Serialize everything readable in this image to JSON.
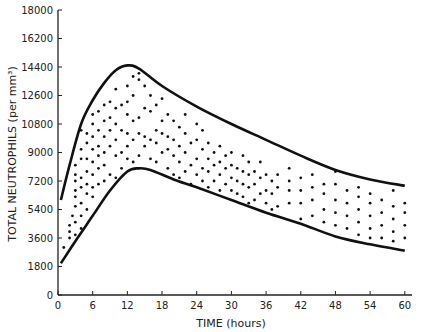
{
  "chart_data": {
    "type": "scatter",
    "title": "",
    "xlabel": "TIME (hours)",
    "ylabel": "TOTAL NEUTROPHILS (per mm³)",
    "xlim": [
      0,
      62
    ],
    "ylim": [
      0,
      18000
    ],
    "x_ticks": [
      0,
      6,
      12,
      18,
      24,
      30,
      36,
      42,
      48,
      54,
      60
    ],
    "y_ticks": [
      0,
      1800,
      3600,
      5400,
      7200,
      9000,
      10800,
      12600,
      14400,
      16200,
      18000
    ],
    "grid": false,
    "legend": null,
    "annotations": "Numerals '2' and '3' mark coincident observations",
    "series": [
      {
        "name": "upper envelope",
        "kind": "line",
        "points": [
          [
            0.5,
            6000
          ],
          [
            2,
            8200
          ],
          [
            4,
            10800
          ],
          [
            6,
            12300
          ],
          [
            8,
            13400
          ],
          [
            10,
            14200
          ],
          [
            12,
            14500
          ],
          [
            14,
            14300
          ],
          [
            18,
            13200
          ],
          [
            24,
            11900
          ],
          [
            30,
            10800
          ],
          [
            36,
            9800
          ],
          [
            42,
            8800
          ],
          [
            48,
            7900
          ],
          [
            54,
            7300
          ],
          [
            60,
            6900
          ]
        ]
      },
      {
        "name": "lower envelope",
        "kind": "line",
        "points": [
          [
            0.5,
            2000
          ],
          [
            3,
            3400
          ],
          [
            6,
            5000
          ],
          [
            9,
            6600
          ],
          [
            12,
            7800
          ],
          [
            14,
            8000
          ],
          [
            16,
            7900
          ],
          [
            20,
            7300
          ],
          [
            24,
            6800
          ],
          [
            30,
            6000
          ],
          [
            36,
            5200
          ],
          [
            42,
            4500
          ],
          [
            48,
            3700
          ],
          [
            54,
            3200
          ],
          [
            60,
            2800
          ]
        ]
      },
      {
        "name": "observations",
        "kind": "scatter",
        "points": [
          [
            1,
            3000
          ],
          [
            2,
            3600
          ],
          [
            2,
            4000
          ],
          [
            2,
            4400
          ],
          [
            2.5,
            5000
          ],
          [
            3,
            3800
          ],
          [
            3,
            4600
          ],
          [
            3,
            5600
          ],
          [
            3,
            6200
          ],
          [
            3,
            6600
          ],
          [
            3,
            7200
          ],
          [
            3,
            7600
          ],
          [
            3,
            8200
          ],
          [
            4,
            4200
          ],
          [
            4,
            5000
          ],
          [
            4,
            5800
          ],
          [
            4,
            6800
          ],
          [
            4,
            7400
          ],
          [
            4,
            8600
          ],
          [
            4,
            9200
          ],
          [
            4,
            10400
          ],
          [
            5,
            5400
          ],
          [
            5,
            6400
          ],
          [
            5,
            7000
          ],
          [
            5,
            7800
          ],
          [
            5,
            8600
          ],
          [
            5,
            9600
          ],
          [
            5,
            10200
          ],
          [
            6,
            6200
          ],
          [
            6,
            6800
          ],
          [
            6,
            7600
          ],
          [
            6,
            8400
          ],
          [
            6,
            9200
          ],
          [
            6,
            10000
          ],
          [
            6,
            10800
          ],
          [
            6,
            11400
          ],
          [
            7,
            7000
          ],
          [
            7,
            8000
          ],
          [
            7,
            8800
          ],
          [
            7,
            9400
          ],
          [
            7,
            10400
          ],
          [
            7,
            11600
          ],
          [
            8,
            7200
          ],
          [
            8,
            8200
          ],
          [
            8,
            9000
          ],
          [
            8,
            10000
          ],
          [
            8,
            11000
          ],
          [
            8,
            12000
          ],
          [
            9,
            7600
          ],
          [
            9,
            9400
          ],
          [
            9,
            10400
          ],
          [
            9,
            11200
          ],
          [
            9,
            12200
          ],
          [
            10,
            7400
          ],
          [
            10,
            8800
          ],
          [
            10,
            9800
          ],
          [
            10,
            10800
          ],
          [
            10,
            11800
          ],
          [
            10,
            13000
          ],
          [
            11,
            8000
          ],
          [
            11,
            9000
          ],
          [
            11,
            10400
          ],
          [
            11,
            12000
          ],
          [
            12,
            8600
          ],
          [
            12,
            9400
          ],
          [
            12,
            10200
          ],
          [
            12,
            11400
          ],
          [
            12,
            12200
          ],
          [
            12,
            13200
          ],
          [
            13,
            8400
          ],
          [
            13,
            9800
          ],
          [
            13,
            11000
          ],
          [
            13,
            12600
          ],
          [
            13,
            13800
          ],
          [
            14,
            8800
          ],
          [
            14,
            10200
          ],
          [
            14,
            11200
          ],
          [
            14,
            13600
          ],
          [
            14,
            14000
          ],
          [
            15,
            9400
          ],
          [
            15,
            10000
          ],
          [
            15,
            11800
          ],
          [
            15,
            13200
          ],
          [
            16,
            8600
          ],
          [
            16,
            9800
          ],
          [
            16,
            11600
          ],
          [
            16,
            12600
          ],
          [
            17,
            8400
          ],
          [
            17,
            9600
          ],
          [
            17,
            10400
          ],
          [
            17,
            12000
          ],
          [
            18,
            9000
          ],
          [
            18,
            10200
          ],
          [
            18,
            11000
          ],
          [
            18,
            12400
          ],
          [
            19,
            8000
          ],
          [
            19,
            9200
          ],
          [
            19,
            10000
          ],
          [
            19,
            11400
          ],
          [
            20,
            7600
          ],
          [
            20,
            8800
          ],
          [
            20,
            9800
          ],
          [
            20,
            11000
          ],
          [
            21,
            7400
          ],
          [
            21,
            8400
          ],
          [
            21,
            9400
          ],
          [
            21,
            10600
          ],
          [
            22,
            7800
          ],
          [
            22,
            9000
          ],
          [
            22,
            10200
          ],
          [
            22,
            11400
          ],
          [
            23,
            7000
          ],
          [
            23,
            8200
          ],
          [
            23,
            9600
          ],
          [
            24,
            7600
          ],
          [
            24,
            8600
          ],
          [
            24,
            9800
          ],
          [
            24,
            10800
          ],
          [
            25,
            7200
          ],
          [
            25,
            8000
          ],
          [
            25,
            9200
          ],
          [
            25,
            10400
          ],
          [
            26,
            6800
          ],
          [
            26,
            7800
          ],
          [
            26,
            8600
          ],
          [
            26,
            9600
          ],
          [
            27,
            7200
          ],
          [
            27,
            8200
          ],
          [
            27,
            9000
          ],
          [
            28,
            6600
          ],
          [
            28,
            7600
          ],
          [
            28,
            8400
          ],
          [
            28,
            9400
          ],
          [
            29,
            7000
          ],
          [
            29,
            8000
          ],
          [
            29,
            8800
          ],
          [
            30,
            6600
          ],
          [
            30,
            7400
          ],
          [
            30,
            8200
          ],
          [
            30,
            9000
          ],
          [
            31,
            6400
          ],
          [
            31,
            7200
          ],
          [
            31,
            8000
          ],
          [
            32,
            6200
          ],
          [
            32,
            7000
          ],
          [
            32,
            7800
          ],
          [
            32,
            8800
          ],
          [
            33,
            5800
          ],
          [
            33,
            6800
          ],
          [
            33,
            7600
          ],
          [
            33,
            8400
          ],
          [
            34,
            6000
          ],
          [
            34,
            7000
          ],
          [
            34,
            7800
          ],
          [
            35,
            6400
          ],
          [
            35,
            7400
          ],
          [
            35,
            8400
          ],
          [
            36,
            5800
          ],
          [
            36,
            6600
          ],
          [
            36,
            7600
          ],
          [
            37,
            5400
          ],
          [
            37,
            6400
          ],
          [
            37,
            7200
          ],
          [
            38,
            5600
          ],
          [
            38,
            6800
          ],
          [
            38,
            7600
          ],
          [
            40,
            5800
          ],
          [
            40,
            6600
          ],
          [
            40,
            7200
          ],
          [
            40,
            8000
          ],
          [
            42,
            4800
          ],
          [
            42,
            5800
          ],
          [
            42,
            6600
          ],
          [
            42,
            7400
          ],
          [
            44,
            5000
          ],
          [
            44,
            6000
          ],
          [
            44,
            6800
          ],
          [
            44,
            7600
          ],
          [
            46,
            4600
          ],
          [
            46,
            5400
          ],
          [
            46,
            6400
          ],
          [
            46,
            7000
          ],
          [
            48,
            4400
          ],
          [
            48,
            5200
          ],
          [
            48,
            6000
          ],
          [
            48,
            7000
          ],
          [
            48,
            7800
          ],
          [
            50,
            4200
          ],
          [
            50,
            5000
          ],
          [
            50,
            5800
          ],
          [
            50,
            6600
          ],
          [
            52,
            3800
          ],
          [
            52,
            4600
          ],
          [
            52,
            5400
          ],
          [
            52,
            6200
          ],
          [
            52,
            6800
          ],
          [
            54,
            3600
          ],
          [
            54,
            4200
          ],
          [
            54,
            5000
          ],
          [
            54,
            5800
          ],
          [
            54,
            6400
          ],
          [
            56,
            3600
          ],
          [
            56,
            4400
          ],
          [
            56,
            5200
          ],
          [
            56,
            6000
          ],
          [
            58,
            3400
          ],
          [
            58,
            4000
          ],
          [
            58,
            4800
          ],
          [
            58,
            5600
          ],
          [
            58,
            6600
          ],
          [
            60,
            3600
          ],
          [
            60,
            4400
          ],
          [
            60,
            5200
          ],
          [
            60,
            5800
          ]
        ]
      }
    ]
  }
}
